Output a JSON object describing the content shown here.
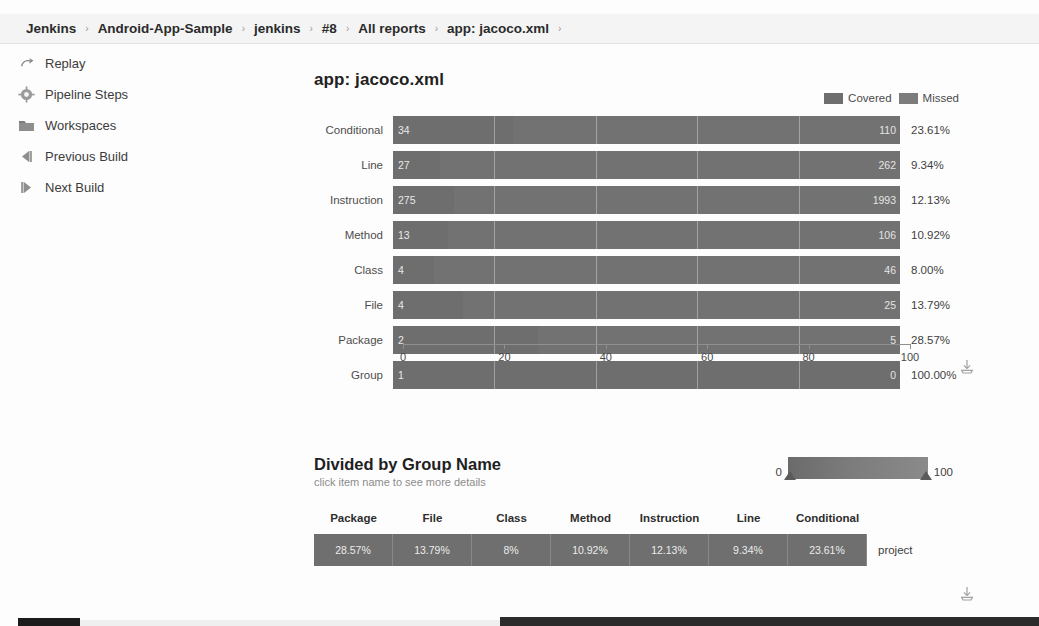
{
  "breadcrumb": {
    "separator": "›",
    "items": [
      {
        "label": "Jenkins"
      },
      {
        "label": "Android-App-Sample"
      },
      {
        "label": "jenkins"
      },
      {
        "label": "#8"
      },
      {
        "label": "All reports"
      },
      {
        "label": "app: jacoco.xml"
      }
    ]
  },
  "sidebar": {
    "items": [
      {
        "label": "Replay",
        "icon": "replay-icon"
      },
      {
        "label": "Pipeline Steps",
        "icon": "gear-icon"
      },
      {
        "label": "Workspaces",
        "icon": "folder-icon"
      },
      {
        "label": "Previous Build",
        "icon": "previous-build-icon"
      },
      {
        "label": "Next Build",
        "icon": "next-build-icon"
      }
    ]
  },
  "main": {
    "title": "app: jacoco.xml",
    "download_label": "download-icon"
  },
  "colors": {
    "covered": "#6e6e6e",
    "missed": "#727272",
    "cell": "#6f6f6f",
    "text": "#333333"
  },
  "chart_data": {
    "type": "bar",
    "orientation": "horizontal",
    "stacked": true,
    "title": "app: jacoco.xml",
    "xlabel": "",
    "ylabel": "",
    "xlim": [
      0,
      100
    ],
    "xticks": [
      0,
      20,
      40,
      60,
      80,
      100
    ],
    "grid": true,
    "legend_position": "top-right",
    "legend": [
      {
        "name": "Covered",
        "color": "#6e6e6e"
      },
      {
        "name": "Missed",
        "color": "#727272"
      }
    ],
    "categories": [
      "Conditional",
      "Line",
      "Instruction",
      "Method",
      "Class",
      "File",
      "Package",
      "Group"
    ],
    "series": [
      {
        "name": "Covered",
        "values": [
          34,
          27,
          275,
          13,
          4,
          4,
          2,
          1
        ]
      },
      {
        "name": "Missed",
        "values": [
          110,
          262,
          1993,
          106,
          46,
          25,
          5,
          0
        ]
      }
    ],
    "percent_labels": [
      "23.61%",
      "9.34%",
      "12.13%",
      "10.92%",
      "8.00%",
      "13.79%",
      "28.57%",
      "100.00%"
    ],
    "percent_values": [
      23.61,
      9.34,
      12.13,
      10.92,
      8.0,
      13.79,
      28.57,
      100.0
    ],
    "rows": [
      {
        "category": "Conditional",
        "covered": "34",
        "missed": "110",
        "percent": "23.61%",
        "covered_pct": 23.61
      },
      {
        "category": "Line",
        "covered": "27",
        "missed": "262",
        "percent": "9.34%",
        "covered_pct": 9.34
      },
      {
        "category": "Instruction",
        "covered": "275",
        "missed": "1993",
        "percent": "12.13%",
        "covered_pct": 12.13
      },
      {
        "category": "Method",
        "covered": "13",
        "missed": "106",
        "percent": "10.92%",
        "covered_pct": 10.92
      },
      {
        "category": "Class",
        "covered": "4",
        "missed": "46",
        "percent": "8.00%",
        "covered_pct": 8.0
      },
      {
        "category": "File",
        "covered": "4",
        "missed": "25",
        "percent": "13.79%",
        "covered_pct": 13.79
      },
      {
        "category": "Package",
        "covered": "2",
        "missed": "5",
        "percent": "28.57%",
        "covered_pct": 28.57
      },
      {
        "category": "Group",
        "covered": "1",
        "missed": "0",
        "percent": "100.00%",
        "covered_pct": 100.0
      }
    ]
  },
  "group_section": {
    "title": "Divided by Group Name",
    "subtitle": "click item name to see more details",
    "scale": {
      "min": "0",
      "max": "100"
    },
    "table": {
      "headers": [
        "Package",
        "File",
        "Class",
        "Method",
        "Instruction",
        "Line",
        "Conditional"
      ],
      "rows": [
        {
          "name": "project",
          "cells": [
            "28.57%",
            "13.79%",
            "8%",
            "10.92%",
            "12.13%",
            "9.34%",
            "23.61%"
          ]
        }
      ]
    },
    "download_label": "download-icon"
  }
}
